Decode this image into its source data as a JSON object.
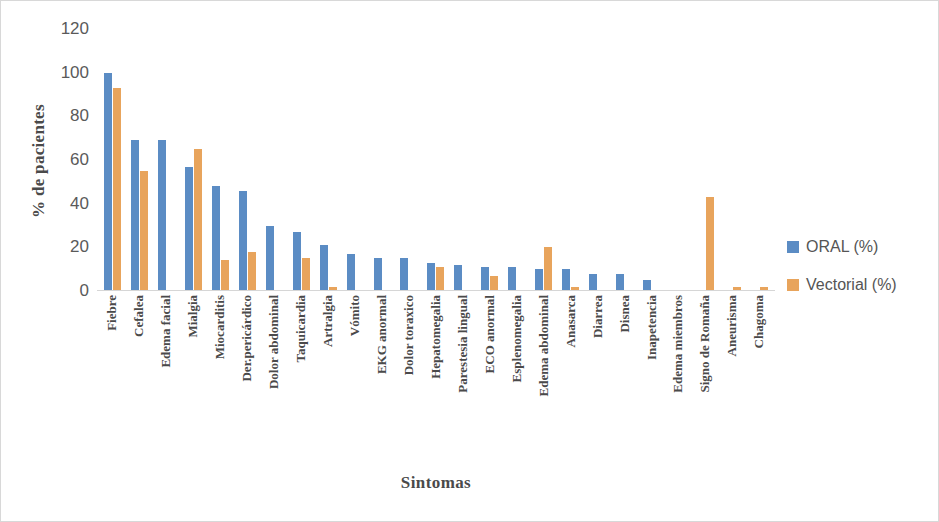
{
  "chart_data": {
    "type": "bar",
    "title": "",
    "xlabel": "Sintomas",
    "ylabel": "% de pacientes",
    "ylim": [
      0,
      120
    ],
    "yticks": [
      0,
      20,
      40,
      60,
      80,
      100,
      120
    ],
    "grid": false,
    "legend_position": "right",
    "categories": [
      "Fiebre",
      "Cefalea",
      "Edema facial",
      "Mialgia",
      "Miocarditis",
      "Der.pericárdico",
      "Dolor abdominal",
      "Taquicardia",
      "Artralgia",
      "Vómito",
      "EKG anormal",
      "Dolor toraxico",
      "Hepatomegalia",
      "Parestesia lingual",
      "ECO anormal",
      "Esplenomegalia",
      "Edema abdominal",
      "Anasarca",
      "Diarrea",
      "Disnea",
      "Inapetencia",
      "Edema miembros",
      "Signo de Romaña",
      "Aneurisma",
      "Chagoma"
    ],
    "series": [
      {
        "name": "ORAL (%)",
        "color": "#5b8cc4",
        "values": [
          100,
          69,
          69,
          57,
          48,
          46,
          30,
          27,
          21,
          17,
          15,
          15,
          13,
          12,
          11,
          11,
          10,
          10,
          8,
          8,
          5,
          0,
          0,
          0,
          0
        ]
      },
      {
        "name": "Vectorial (%)",
        "color": "#e8a45c",
        "values": [
          93,
          55,
          0,
          65,
          14,
          18,
          0,
          15,
          2,
          0,
          0,
          0,
          11,
          0,
          7,
          0,
          20,
          2,
          0,
          0,
          0,
          0,
          43,
          2,
          2
        ]
      }
    ]
  },
  "legend": {
    "entries": [
      {
        "label": "ORAL (%)",
        "color": "#5b8cc4"
      },
      {
        "label": "Vectorial (%)",
        "color": "#e8a45c"
      }
    ]
  }
}
